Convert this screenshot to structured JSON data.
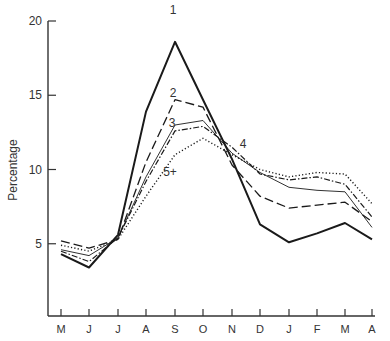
{
  "chart_data": {
    "type": "line",
    "title": "",
    "xlabel": "",
    "ylabel": "Percentage",
    "categories": [
      "M",
      "J",
      "J",
      "A",
      "S",
      "O",
      "N",
      "D",
      "J",
      "F",
      "M",
      "A"
    ],
    "yticks": [
      5,
      10,
      15,
      20
    ],
    "ylim": [
      0,
      20
    ],
    "grid": false,
    "legend_position": "inline labels near peak",
    "series": [
      {
        "name": "1",
        "style": "solid-thick",
        "label_at": [
          173,
          14
        ],
        "values": [
          4.3,
          3.4,
          5.6,
          13.9,
          18.6,
          14.7,
          10.7,
          6.3,
          5.1,
          5.7,
          6.4,
          5.3
        ]
      },
      {
        "name": "2",
        "style": "long-dash",
        "label_at": [
          173,
          97
        ],
        "values": [
          5.2,
          4.7,
          5.3,
          10.5,
          14.7,
          14.2,
          10.3,
          8.2,
          7.4,
          7.6,
          7.8,
          6.5
        ]
      },
      {
        "name": "3",
        "style": "solid-thin",
        "label_at": [
          172,
          127
        ],
        "values": [
          4.6,
          4.2,
          5.4,
          9.5,
          13.0,
          13.3,
          11.1,
          9.8,
          8.8,
          8.6,
          8.5,
          6.1
        ]
      },
      {
        "name": "4",
        "style": "dash-dot",
        "label_at": [
          243,
          148
        ],
        "values": [
          4.5,
          3.8,
          5.4,
          9.2,
          12.6,
          12.9,
          11.5,
          9.7,
          9.3,
          9.5,
          9.0,
          6.8
        ]
      },
      {
        "name": "5+",
        "style": "dotted",
        "label_at": [
          170,
          176
        ],
        "values": [
          4.9,
          4.5,
          5.3,
          8.2,
          11.0,
          12.1,
          11.0,
          10.0,
          9.5,
          9.8,
          9.7,
          7.7
        ]
      }
    ]
  }
}
